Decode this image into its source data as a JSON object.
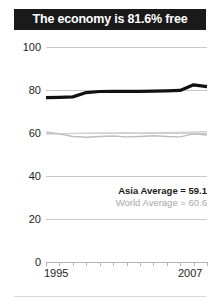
{
  "title": {
    "text": "The economy is 81.6% free"
  },
  "annotations": {
    "asia": "Asia Average = 59.1",
    "world": "World Average = 60.6"
  },
  "axis": {
    "x_start_label": "1995",
    "x_end_label": "2007"
  },
  "colors": {
    "banner_bg": "#1a1a1a",
    "banner_text": "#ffffff",
    "main_series": "#111111",
    "asia_series": "#bdbdbd",
    "world_series": "#d2d2d2",
    "gridline": "#c9c9c9",
    "axis": "#b4b4b4",
    "annotation_gray": "#a7a7a7"
  },
  "chart_data": {
    "type": "line",
    "title": "The economy is 81.6% free",
    "xlabel": "",
    "ylabel": "",
    "xlim": [
      1995,
      2007
    ],
    "ylim": [
      0,
      100
    ],
    "yticks": [
      100,
      80,
      60,
      40,
      20,
      0
    ],
    "ytick_labels": [
      "100",
      "80",
      "60",
      "40",
      "20",
      "0"
    ],
    "xticks": [
      1995,
      1996,
      1997,
      1998,
      1999,
      2000,
      2001,
      2002,
      2003,
      2004,
      2005,
      2006,
      2007
    ],
    "xtick_labels_shown": [
      "1995",
      "2007"
    ],
    "grid": true,
    "legend": "none",
    "x": [
      1995,
      1996,
      1997,
      1998,
      1999,
      2000,
      2001,
      2002,
      2003,
      2004,
      2005,
      2006,
      2007
    ],
    "series": [
      {
        "name": "Economy (country score)",
        "color": "#111111",
        "width": 3.2,
        "values": [
          76.5,
          76.6,
          76.8,
          78.8,
          79.3,
          79.4,
          79.4,
          79.4,
          79.5,
          79.6,
          79.8,
          82.4,
          81.6
        ]
      },
      {
        "name": "Asia Average",
        "color": "#bdbdbd",
        "width": 1.4,
        "values": [
          60.5,
          59.6,
          58.4,
          58.0,
          58.4,
          58.6,
          58.2,
          58.4,
          58.7,
          58.4,
          58.2,
          59.6,
          59.1
        ]
      },
      {
        "name": "World Average",
        "color": "#d2d2d2",
        "width": 1.4,
        "values": [
          59.5,
          59.6,
          59.8,
          59.9,
          60.0,
          60.0,
          60.1,
          60.0,
          60.1,
          60.2,
          60.3,
          60.5,
          60.6
        ]
      }
    ],
    "annotations": [
      {
        "label": "Asia Average = 59.1",
        "value": 59.1,
        "style": "bold-dark"
      },
      {
        "label": "World Average = 60.6",
        "value": 60.6,
        "style": "gray"
      }
    ]
  }
}
